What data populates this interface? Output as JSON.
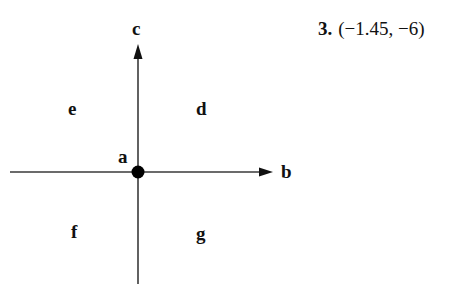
{
  "problem": {
    "number": "3.",
    "point": "(−1.45, −6)"
  },
  "diagram": {
    "labels": {
      "a": "a",
      "b": "b",
      "c": "c",
      "d": "d",
      "e": "e",
      "f": "f",
      "g": "g"
    },
    "colors": {
      "line": "#3a3a3a",
      "point": "#000000",
      "text": "#111111"
    }
  }
}
